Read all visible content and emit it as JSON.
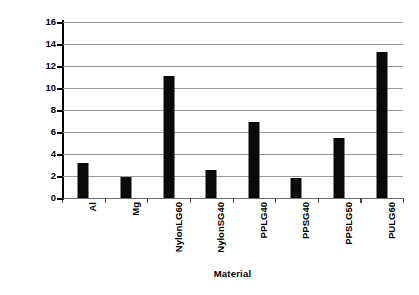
{
  "chart_data": {
    "type": "bar",
    "title": "",
    "subtitle": "",
    "xlabel": "Material",
    "ylabel": "Notched Izod (ft-lb/in)",
    "categories": [
      "Al",
      "Mg",
      "NylonLG60",
      "NylonSG40",
      "PPLG40",
      "PPSG40",
      "PPSLG50",
      "PULG60"
    ],
    "values": [
      3.2,
      1.95,
      11.1,
      2.55,
      6.9,
      1.85,
      5.45,
      13.3
    ],
    "ylim": [
      0,
      16
    ],
    "ytick_step": 2,
    "ytick_labels": [
      "0",
      "2",
      "4",
      "6",
      "8",
      "10",
      "12",
      "14",
      "16"
    ],
    "grid": "horizontal",
    "legend": "none",
    "series": [
      {
        "name": "Notched Izod",
        "values": [
          3.2,
          1.95,
          11.1,
          2.55,
          6.9,
          1.85,
          5.45,
          13.3
        ]
      }
    ],
    "annotations": []
  },
  "style": {
    "bar_color": "#0a0a0a",
    "gridline_color": "#9a9a9a",
    "axis_color": "#000000",
    "text_color": "#000000",
    "background_color": "#ffffff"
  }
}
